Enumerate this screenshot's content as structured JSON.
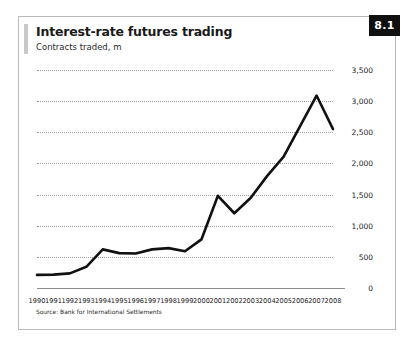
{
  "figure": {
    "badge": "8.1",
    "title": "Interest-rate futures trading",
    "subtitle": "Contracts traded, m",
    "source": "Source: Bank for International Settlements"
  },
  "colors": {
    "line": "#111111",
    "gridline": "#9b9b9b",
    "axis": "#8c8c8c",
    "badge_background": "#101010",
    "badge_text": "#ffffff",
    "frame_border": "#b9b9b9",
    "title_accent": "#c9c9c9"
  },
  "chart_data": {
    "type": "line",
    "title": "Interest-rate futures trading",
    "subtitle": "Contracts traded, m",
    "xlabel": "",
    "ylabel": "Contracts traded, m",
    "ylim": [
      0,
      3500
    ],
    "yticks": [
      0,
      500,
      1000,
      1500,
      2000,
      2500,
      3000,
      3500
    ],
    "ytick_labels": [
      "0",
      "500",
      "1,000",
      "1,500",
      "2,000",
      "2,500",
      "3,000",
      "3,500"
    ],
    "grid": true,
    "legend": false,
    "categories": [
      "1990",
      "1991",
      "1992",
      "1993",
      "1994",
      "1995",
      "1996",
      "1997",
      "1998",
      "1999",
      "2000",
      "2001",
      "2002",
      "2003",
      "2004",
      "2005",
      "2006",
      "2007",
      "2008"
    ],
    "values": [
      210,
      215,
      235,
      340,
      620,
      560,
      555,
      620,
      640,
      590,
      780,
      1480,
      1200,
      1450,
      1800,
      2110,
      2600,
      3090,
      2550
    ],
    "source": "Source: Bank for International Settlements"
  }
}
